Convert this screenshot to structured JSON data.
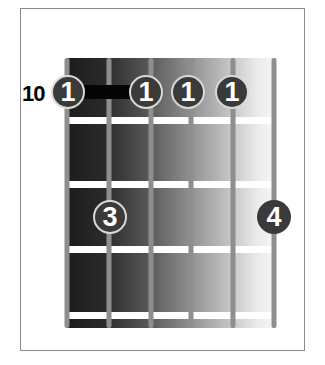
{
  "diagram": {
    "type": "guitar-chord-chart",
    "start_fret_label": "10",
    "num_strings": 6,
    "num_frets_shown": 4,
    "barre": {
      "from_string": 1,
      "to_string": 2,
      "fret": 1
    },
    "fingers": [
      {
        "string": 1,
        "fret": 1,
        "finger": "1"
      },
      {
        "string": 3,
        "fret": 1,
        "finger": "1"
      },
      {
        "string": 4,
        "fret": 1,
        "finger": "1"
      },
      {
        "string": 5,
        "fret": 1,
        "finger": "1"
      },
      {
        "string": 2,
        "fret": 3,
        "finger": "3"
      },
      {
        "string": 6,
        "fret": 3,
        "finger": "4"
      }
    ],
    "colors": {
      "frame": "#8a8a8a",
      "string": "#8e8e8e",
      "fret": "#ffffff",
      "dot": "#3a3a3a",
      "dot_ring": "#d8d8d8",
      "barre": "#050505"
    }
  }
}
